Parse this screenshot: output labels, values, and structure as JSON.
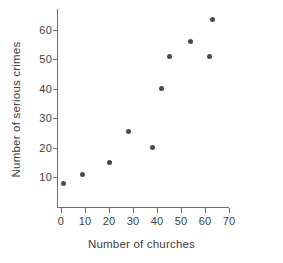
{
  "chart_data": {
    "type": "scatter",
    "title": "",
    "xlabel": "Number of churches",
    "ylabel": "Number of serious crimes",
    "xlim": [
      0,
      70
    ],
    "ylim": [
      0,
      66
    ],
    "xticks": [
      0,
      10,
      20,
      30,
      40,
      50,
      60,
      70
    ],
    "yticks": [
      10,
      20,
      30,
      40,
      50,
      60
    ],
    "grid": false,
    "legend": null,
    "marker_color": "#4a4a4a",
    "axis_color": "#6e6e6e",
    "points": [
      {
        "x": 1,
        "y": 8
      },
      {
        "x": 9,
        "y": 11
      },
      {
        "x": 20,
        "y": 15
      },
      {
        "x": 28,
        "y": 25.5
      },
      {
        "x": 38,
        "y": 20
      },
      {
        "x": 42,
        "y": 40
      },
      {
        "x": 45,
        "y": 51
      },
      {
        "x": 54,
        "y": 56
      },
      {
        "x": 62,
        "y": 51
      },
      {
        "x": 63,
        "y": 63.5
      }
    ]
  }
}
